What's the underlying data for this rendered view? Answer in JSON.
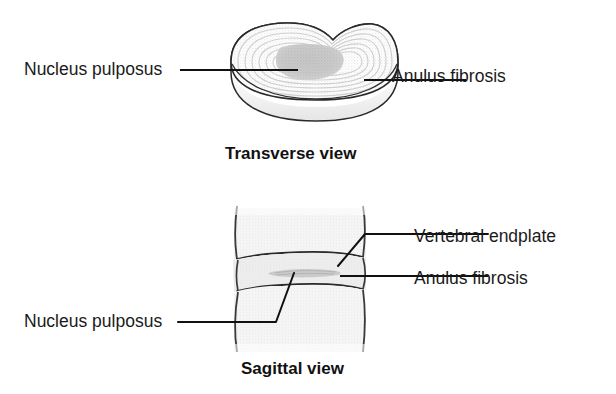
{
  "figure": {
    "background_color": "#ffffff",
    "ink_color": "#1a1a1a"
  },
  "panels": [
    {
      "id": "transverse",
      "caption": "Transverse view",
      "labels": [
        {
          "id": "nucleus-pulposus",
          "text": "Nucleus pulposus",
          "side": "left"
        },
        {
          "id": "anulus-fibrosis",
          "text": "Anulus fibrosis",
          "side": "right"
        }
      ]
    },
    {
      "id": "sagittal",
      "caption": "Sagittal view",
      "labels": [
        {
          "id": "vertebral-endplate",
          "text": "Vertebral endplate",
          "side": "right"
        },
        {
          "id": "anulus-fibrosis",
          "text": "Anulus fibrosis",
          "side": "right"
        },
        {
          "id": "nucleus-pulposus",
          "text": "Nucleus pulposus",
          "side": "left"
        }
      ]
    }
  ],
  "labels": {
    "nucleus_pulposus_transverse": "Nucleus pulposus",
    "anulus_fibrosis_transverse": "Anulus fibrosis",
    "vertebral_endplate_sagittal": "Vertebral endplate",
    "anulus_fibrosis_sagittal": "Anulus fibrosis",
    "nucleus_pulposus_sagittal": "Nucleus pulposus"
  },
  "captions": {
    "transverse": "Transverse view",
    "sagittal": "Sagittal view"
  },
  "colors": {
    "outline": "#1a1a1a",
    "leader_line": "#111111",
    "disc_body_fill": "#fbfbfb",
    "lamella_stroke": "#d8d8d8",
    "nucleus_fill": "#c9c9c9",
    "vertebra_fill": "#f2f2f2",
    "disc_fill": "#ececec",
    "shadow": "#e4e4e4",
    "background": "#ffffff"
  },
  "icons": {
    "leader_line": "leader-line-icon",
    "disc_transverse": "intervertebral-disc-transverse-icon",
    "spine_sagittal": "spine-segment-sagittal-icon"
  }
}
